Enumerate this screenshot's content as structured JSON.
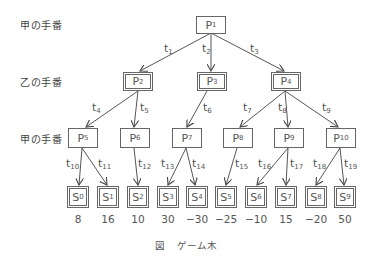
{
  "turn_labels": {
    "level0": "甲の手番",
    "level1": "乙の手番",
    "level2": "甲の手番"
  },
  "nodes": {
    "P1": {
      "base": "P",
      "sub": "1"
    },
    "P2": {
      "base": "P",
      "sub": "2"
    },
    "P3": {
      "base": "P",
      "sub": "3"
    },
    "P4": {
      "base": "P",
      "sub": "4"
    },
    "P5": {
      "base": "P",
      "sub": "5"
    },
    "P6": {
      "base": "P",
      "sub": "6"
    },
    "P7": {
      "base": "P",
      "sub": "7"
    },
    "P8": {
      "base": "P",
      "sub": "8"
    },
    "P9": {
      "base": "P",
      "sub": "9"
    },
    "P10": {
      "base": "P",
      "sub": "10"
    },
    "S0": {
      "base": "S",
      "sub": "0"
    },
    "S1": {
      "base": "S",
      "sub": "1"
    },
    "S2": {
      "base": "S",
      "sub": "2"
    },
    "S3": {
      "base": "S",
      "sub": "3"
    },
    "S4": {
      "base": "S",
      "sub": "4"
    },
    "S5": {
      "base": "S",
      "sub": "5"
    },
    "S6": {
      "base": "S",
      "sub": "6"
    },
    "S7": {
      "base": "S",
      "sub": "7"
    },
    "S8": {
      "base": "S",
      "sub": "8"
    },
    "S9": {
      "base": "S",
      "sub": "9"
    }
  },
  "edges": {
    "t1": {
      "base": "t",
      "sub": "1",
      "from": "P1",
      "to": "P2"
    },
    "t2": {
      "base": "t",
      "sub": "2",
      "from": "P1",
      "to": "P3"
    },
    "t3": {
      "base": "t",
      "sub": "3",
      "from": "P1",
      "to": "P4"
    },
    "t4": {
      "base": "t",
      "sub": "4",
      "from": "P2",
      "to": "P5"
    },
    "t5": {
      "base": "t",
      "sub": "5",
      "from": "P2",
      "to": "P6"
    },
    "t6": {
      "base": "t",
      "sub": "6",
      "from": "P3",
      "to": "P7"
    },
    "t7": {
      "base": "t",
      "sub": "7",
      "from": "P4",
      "to": "P8"
    },
    "t8": {
      "base": "t",
      "sub": "8",
      "from": "P4",
      "to": "P9"
    },
    "t9": {
      "base": "t",
      "sub": "9",
      "from": "P4",
      "to": "P10"
    },
    "t10": {
      "base": "t",
      "sub": "10",
      "from": "P5",
      "to": "S0"
    },
    "t11": {
      "base": "t",
      "sub": "11",
      "from": "P5",
      "to": "S1"
    },
    "t12": {
      "base": "t",
      "sub": "12",
      "from": "P6",
      "to": "S2"
    },
    "t13": {
      "base": "t",
      "sub": "13",
      "from": "P7",
      "to": "S3"
    },
    "t14": {
      "base": "t",
      "sub": "14",
      "from": "P7",
      "to": "S4"
    },
    "t15": {
      "base": "t",
      "sub": "15",
      "from": "P8",
      "to": "S5"
    },
    "t16": {
      "base": "t",
      "sub": "16",
      "from": "P9",
      "to": "S6"
    },
    "t17": {
      "base": "t",
      "sub": "17",
      "from": "P9",
      "to": "S7"
    },
    "t18": {
      "base": "t",
      "sub": "18",
      "from": "P10",
      "to": "S8"
    },
    "t19": {
      "base": "t",
      "sub": "19",
      "from": "P10",
      "to": "S9"
    }
  },
  "leaf_values": {
    "S0": "8",
    "S1": "16",
    "S2": "10",
    "S3": "30",
    "S4": "−30",
    "S5": "−25",
    "S6": "−10",
    "S7": "15",
    "S8": "−20",
    "S9": "50"
  },
  "caption": {
    "figure": "図",
    "title": "ゲーム木"
  },
  "colors": {
    "line": "#555555",
    "box_border": "#666666",
    "text": "#555555"
  }
}
